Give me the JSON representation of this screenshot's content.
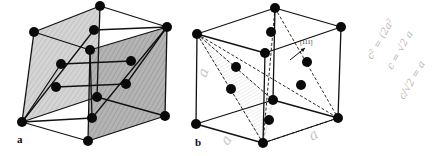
{
  "colors": {
    "line": "#111111",
    "atom": "#0a0a0a",
    "shade_light": "#c9c9c9",
    "shade_dark": "#a8a8a8",
    "hatch": "#d0d0d0",
    "handwriting": "#b8b8b8"
  },
  "figure_a": {
    "label": "a",
    "label_pos": [
      17,
      143
    ],
    "atoms": [
      [
        34,
        32
      ],
      [
        100,
        6
      ],
      [
        94,
        30
      ],
      [
        167,
        27
      ],
      [
        90,
        50
      ],
      [
        61,
        64
      ],
      [
        131,
        61
      ],
      [
        56,
        87
      ],
      [
        126,
        84
      ],
      [
        97,
        97
      ],
      [
        22,
        122
      ],
      [
        92,
        118
      ],
      [
        165,
        116
      ],
      [
        88,
        141
      ]
    ],
    "edges": [
      [
        [
          34,
          32
        ],
        [
          100,
          6
        ]
      ],
      [
        [
          100,
          6
        ],
        [
          167,
          27
        ]
      ],
      [
        [
          34,
          32
        ],
        [
          90,
          50
        ]
      ],
      [
        [
          90,
          50
        ],
        [
          167,
          27
        ]
      ],
      [
        [
          34,
          32
        ],
        [
          22,
          122
        ]
      ],
      [
        [
          90,
          50
        ],
        [
          92,
          118
        ]
      ],
      [
        [
          167,
          27
        ],
        [
          165,
          116
        ]
      ],
      [
        [
          100,
          6
        ],
        [
          97,
          97
        ]
      ],
      [
        [
          22,
          122
        ],
        [
          88,
          141
        ]
      ],
      [
        [
          88,
          141
        ],
        [
          165,
          116
        ]
      ],
      [
        [
          22,
          122
        ],
        [
          97,
          97
        ]
      ],
      [
        [
          97,
          97
        ],
        [
          165,
          116
        ]
      ],
      [
        [
          90,
          50
        ],
        [
          88,
          141
        ]
      ],
      [
        [
          94,
          30
        ],
        [
          167,
          27
        ]
      ],
      [
        [
          61,
          64
        ],
        [
          131,
          61
        ]
      ],
      [
        [
          56,
          87
        ],
        [
          126,
          84
        ]
      ],
      [
        [
          22,
          122
        ],
        [
          94,
          30
        ]
      ],
      [
        [
          22,
          122
        ],
        [
          61,
          64
        ]
      ],
      [
        [
          22,
          122
        ],
        [
          92,
          118
        ]
      ],
      [
        [
          167,
          27
        ],
        [
          92,
          118
        ]
      ],
      [
        [
          167,
          27
        ],
        [
          126,
          84
        ]
      ]
    ],
    "shaded_faces": [
      {
        "points": [
          [
            34,
            32
          ],
          [
            100,
            6
          ],
          [
            97,
            97
          ],
          [
            22,
            122
          ]
        ],
        "tone": "light"
      },
      {
        "points": [
          [
            90,
            50
          ],
          [
            167,
            27
          ],
          [
            165,
            116
          ],
          [
            88,
            141
          ]
        ],
        "tone": "dark"
      }
    ]
  },
  "figure_b": {
    "label": "b",
    "label_pos": [
      195,
      146
    ],
    "miller_label": "[111]",
    "miller_pos": [
      300,
      44
    ],
    "arrow": {
      "from": [
        290,
        60
      ],
      "to": [
        305,
        48
      ]
    },
    "atoms": [
      [
        197,
        34
      ],
      [
        275,
        8
      ],
      [
        271,
        32
      ],
      [
        341,
        27
      ],
      [
        265,
        53
      ],
      [
        236,
        67
      ],
      [
        307,
        62
      ],
      [
        231,
        89
      ],
      [
        301,
        85
      ],
      [
        273,
        100
      ],
      [
        196,
        124
      ],
      [
        269,
        120
      ],
      [
        338,
        118
      ],
      [
        263,
        143
      ]
    ],
    "edges": [
      [
        [
          197,
          34
        ],
        [
          275,
          8
        ]
      ],
      [
        [
          275,
          8
        ],
        [
          341,
          27
        ]
      ],
      [
        [
          197,
          34
        ],
        [
          265,
          53
        ]
      ],
      [
        [
          265,
          53
        ],
        [
          341,
          27
        ]
      ],
      [
        [
          197,
          34
        ],
        [
          196,
          124
        ]
      ],
      [
        [
          265,
          53
        ],
        [
          263,
          143
        ]
      ],
      [
        [
          341,
          27
        ],
        [
          338,
          118
        ]
      ],
      [
        [
          275,
          8
        ],
        [
          273,
          100
        ]
      ],
      [
        [
          196,
          124
        ],
        [
          263,
          143
        ]
      ],
      [
        [
          263,
          143
        ],
        [
          338,
          118
        ]
      ],
      [
        [
          196,
          124
        ],
        [
          273,
          100
        ]
      ],
      [
        [
          273,
          100
        ],
        [
          338,
          118
        ]
      ]
    ],
    "dashed_edges": [
      [
        [
          197,
          34
        ],
        [
          263,
          143
        ]
      ],
      [
        [
          197,
          34
        ],
        [
          273,
          100
        ]
      ],
      [
        [
          275,
          8
        ],
        [
          338,
          118
        ]
      ],
      [
        [
          275,
          8
        ],
        [
          263,
          143
        ]
      ],
      [
        [
          263,
          143
        ],
        [
          338,
          118
        ]
      ],
      [
        [
          197,
          34
        ],
        [
          338,
          118
        ]
      ]
    ],
    "hatched_triangle": [
      [
        197,
        34
      ],
      [
        273,
        100
      ],
      [
        263,
        143
      ]
    ]
  },
  "handwriting": {
    "side_a_glyphs": [
      {
        "text": "a",
        "x": 206,
        "y": 78,
        "rot": -70
      },
      {
        "text": "a",
        "x": 228,
        "y": 146,
        "rot": -60
      },
      {
        "text": "a",
        "x": 312,
        "y": 141,
        "rot": -30
      }
    ],
    "equations": [
      {
        "text": "c² = (2a²",
        "x": 372,
        "y": 60,
        "rot": -60
      },
      {
        "text": "c = √2 a",
        "x": 392,
        "y": 70,
        "rot": -60
      },
      {
        "text": "c/√2 = a",
        "x": 404,
        "y": 100,
        "rot": -60
      }
    ]
  }
}
